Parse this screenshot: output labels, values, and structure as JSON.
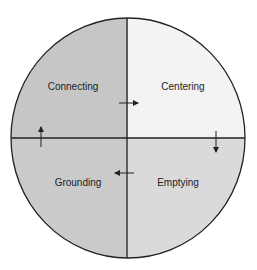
{
  "caption": "(cut-off caption text, illegible)",
  "diagram": {
    "type": "four-quadrant cycle",
    "quadrants": [
      {
        "id": "top-left",
        "label": "Connecting",
        "color": "#c6c6c6"
      },
      {
        "id": "top-right",
        "label": "Centering",
        "color": "#f3f3f3"
      },
      {
        "id": "bottom-right",
        "label": "Emptying",
        "color": "#dadada"
      },
      {
        "id": "bottom-left",
        "label": "Grounding",
        "color": "#cacaca"
      }
    ],
    "flow": [
      "Connecting",
      "Centering",
      "Emptying",
      "Grounding",
      "Connecting"
    ],
    "line_color": "#222222"
  }
}
